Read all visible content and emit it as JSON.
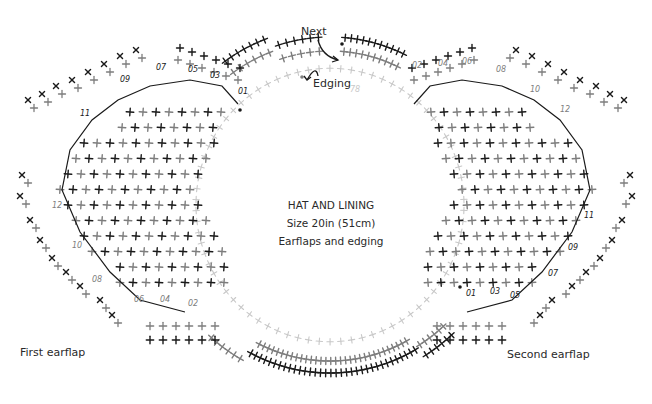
{
  "title": {
    "line1": "HAT AND LINING",
    "line2": "Size 20in (51cm)",
    "line3": "Earflaps and edging"
  },
  "labels": {
    "next": "Next",
    "edging": "Edging",
    "first_earflap": "First earflap",
    "second_earflap": "Second earflap",
    "ring_row_number": "78"
  },
  "colors": {
    "dark_stitch": "#1a1a1a",
    "mid_stitch": "#7d7d7d",
    "faint_stitch": "#c8c8c8",
    "text": "#2a2a2a",
    "background": "#ffffff"
  },
  "legend_symbols": {
    "plus": "single crochet (+)",
    "x": "single crochet worked in back loop (x)",
    "dot": "slip stitch / start marker (•)"
  },
  "first_earflap_rows": [
    "01",
    "03",
    "05",
    "07",
    "09",
    "11",
    "12",
    "10",
    "08",
    "06",
    "04",
    "02"
  ],
  "second_earflap_rows": [
    "02",
    "04",
    "06",
    "08",
    "10",
    "12",
    "11",
    "09",
    "07",
    "05",
    "03",
    "01"
  ],
  "ring": {
    "center_x": 330,
    "center_y": 205,
    "faint_radius": 134,
    "edging_inner_radius": 155,
    "edging_outer_radius": 170
  }
}
